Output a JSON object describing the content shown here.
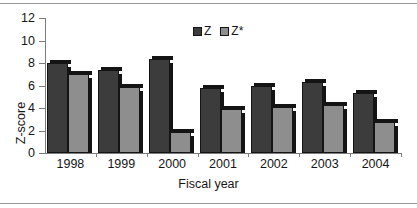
{
  "chart_data": {
    "type": "bar",
    "title": "",
    "xlabel": "Fiscal year",
    "ylabel": "Z-score",
    "categories": [
      "1998",
      "1999",
      "2000",
      "2001",
      "2002",
      "2003",
      "2004"
    ],
    "series": [
      {
        "name": "Z",
        "color": "#3c3c3c",
        "values": [
          8.0,
          7.4,
          8.4,
          5.8,
          6.0,
          6.3,
          5.3
        ]
      },
      {
        "name": "Z*",
        "color": "#8e8e8e",
        "values": [
          7.0,
          5.9,
          1.9,
          3.9,
          4.1,
          4.3,
          2.8
        ]
      }
    ],
    "ylim": [
      0,
      12
    ],
    "yticks": [
      0,
      2,
      4,
      6,
      8,
      10,
      12
    ],
    "ytick_labels": [
      "0",
      "2",
      "4",
      "6",
      "8",
      "10",
      "12"
    ],
    "grid": false,
    "legend_position": "top-center",
    "legend_entries": [
      "Z",
      "Z*"
    ]
  }
}
